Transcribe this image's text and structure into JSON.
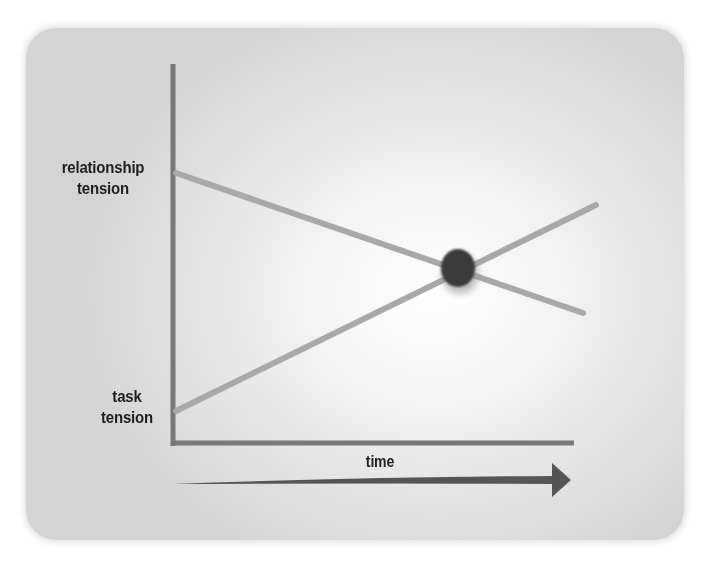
{
  "diagram": {
    "title": "",
    "y_axis": {
      "top_label": "relationship tension",
      "top_label_lines": [
        "relationship",
        "tension"
      ],
      "bottom_label": "task tension",
      "bottom_label_lines": [
        "task",
        "tension"
      ]
    },
    "x_axis": {
      "label": "time",
      "arrow": "right-arrow"
    },
    "lines": [
      {
        "name": "relationship tension",
        "trend": "decreasing",
        "from": [
          175,
          173
        ],
        "to": [
          583,
          313
        ]
      },
      {
        "name": "task tension",
        "trend": "increasing",
        "from": [
          175,
          411
        ],
        "to": [
          596,
          205
        ]
      }
    ],
    "intersection": {
      "label": "crossover point",
      "position": [
        458,
        268
      ]
    },
    "colors": {
      "axis": "#787878",
      "line": "#a8a8a8",
      "dot": "#3a3a3a",
      "arrow": "#555555",
      "text": "#1e1e1e",
      "background_center": "#ffffff",
      "background_edge": "#d4d4d4"
    }
  }
}
